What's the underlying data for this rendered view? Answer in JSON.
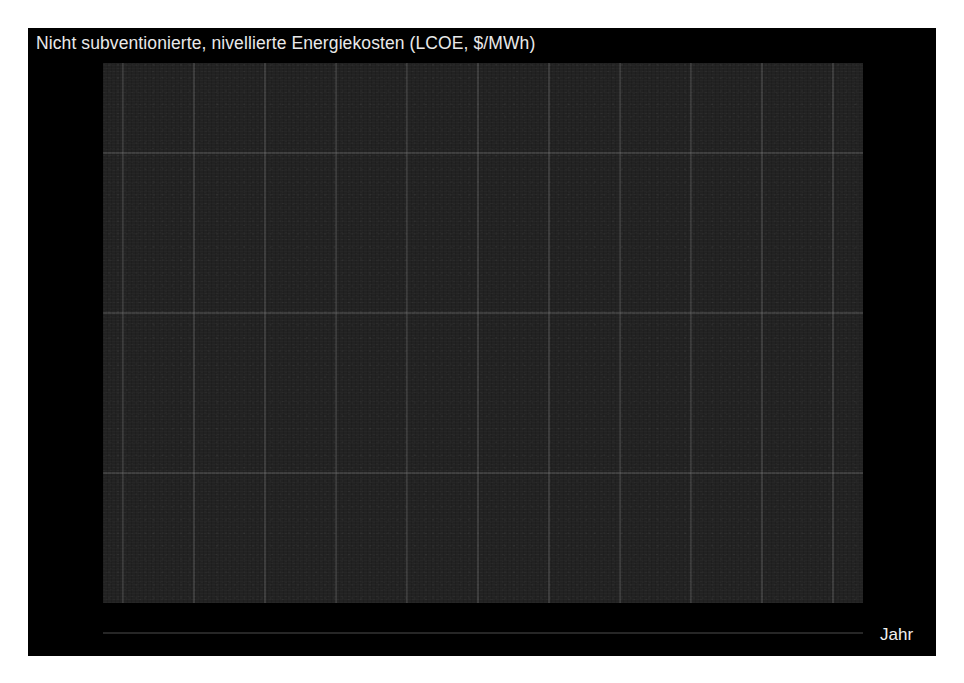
{
  "title": "Nicht subventionierte, nivellierte Energiekosten (LCOE, $/MWh)",
  "axes": {
    "x_name": "Jahr",
    "y_ticks": [
      "$320",
      "$160",
      "$80",
      "$40"
    ],
    "x_ticks": [
      "2009",
      "2010",
      "2011",
      "2012",
      "2013",
      "2014",
      "2015",
      "2016",
      "2017",
      "2018",
      "2019"
    ]
  },
  "series_labels": {
    "nuklear": "Nuklear",
    "steinkohle": "Steinkohle",
    "erdgas_line1": "Erdgas",
    "erdgas_line2": "mit KWK",
    "wind": "Wind",
    "solar": "Solarzellen"
  },
  "colors": {
    "background": "#000000",
    "plot_background": "#222222",
    "grid": "#8a8a8a",
    "text": "#f0f0f0",
    "label_text": "#9d9d9d",
    "solar": "#f2f2f2",
    "wind": "#8f8f8f",
    "erdgas": "#b4b4b4",
    "steinkohle": "#a8a8a8",
    "nuklear": "#6e6e6e"
  },
  "chart_data": {
    "type": "line",
    "title": "Nicht subventionierte, nivellierte Energiekosten (LCOE, $/MWh)",
    "xlabel": "Jahr",
    "ylabel": "",
    "yscale": "log",
    "ylim": [
      36,
      400
    ],
    "grid": true,
    "legend": "right-inline-labels",
    "x": [
      2009,
      2010,
      2011,
      2012,
      2013,
      2014,
      2015,
      2016,
      2017,
      2018,
      2019
    ],
    "series": [
      {
        "name": "Solarzellen",
        "color": "#f2f2f2",
        "values": [
          323,
          248,
          157,
          125,
          98,
          79,
          64,
          55,
          50,
          43,
          40
        ]
      },
      {
        "name": "Wind",
        "color": "#8f8f8f",
        "values": [
          135,
          124,
          80,
          76,
          72,
          71,
          59,
          55,
          47,
          42,
          41
        ]
      },
      {
        "name": "Erdgas mit KWK",
        "color": "#b4b4b4",
        "values": [
          83,
          83,
          81,
          78,
          75,
          74,
          68,
          65,
          63,
          61,
          57
        ]
      },
      {
        "name": "Steinkohle",
        "color": "#a8a8a8",
        "values": [
          111,
          111,
          111,
          104,
          102,
          109,
          107,
          102,
          102,
          102,
          109
        ]
      },
      {
        "name": "Nuklear",
        "color": "#6e6e6e",
        "values": [
          123,
          97,
          96,
          104,
          100,
          109,
          112,
          117,
          150,
          154,
          155
        ]
      }
    ]
  }
}
